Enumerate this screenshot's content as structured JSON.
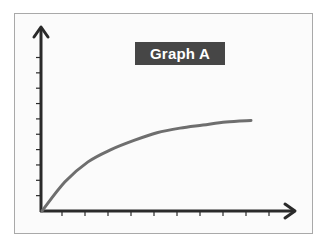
{
  "chart_data": {
    "type": "line",
    "title": "Graph A",
    "xlabel": "",
    "ylabel": "",
    "x": [
      0,
      1,
      2,
      3,
      4,
      5,
      6,
      7,
      8,
      9
    ],
    "series": [
      {
        "name": "Graph A",
        "values": [
          0,
          1.9,
          3.2,
          4.0,
          4.6,
          5.1,
          5.4,
          5.6,
          5.8,
          5.9
        ],
        "color": "#6e6e6e"
      }
    ],
    "x_ticks": 10,
    "y_ticks": 10,
    "tick_labels_shown": false,
    "xlim": [
      0,
      10.5
    ],
    "ylim": [
      0,
      11.5
    ],
    "grid": false,
    "legend": null,
    "shape": "concave increasing, approaching a horizontal asymptote"
  },
  "colors": {
    "axis": "#2a2a2a",
    "curve": "#6e6e6e",
    "title_bg": "#464646",
    "title_text": "#ffffff",
    "frame_border": "#a9a9a9"
  }
}
